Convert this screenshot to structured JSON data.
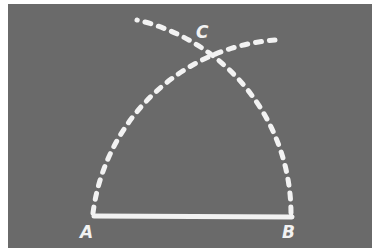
{
  "figure": {
    "colors": {
      "board": "#6a6a6a",
      "chalk": "#f2f2f2",
      "frame": "#ffffff"
    },
    "points": [
      {
        "id": "A",
        "label": "A",
        "x": 93,
        "y": 216
      },
      {
        "id": "B",
        "label": "B",
        "x": 292,
        "y": 216
      },
      {
        "id": "C",
        "label": "C",
        "x": 198,
        "y": 55
      }
    ],
    "segment_AB": {
      "style": "solid"
    },
    "arc_centered_B": {
      "style": "dashed",
      "from": "A",
      "to_end": [
        273,
        40
      ]
    },
    "arc_centered_A": {
      "style": "dashed",
      "from": "B",
      "to_end": [
        137,
        20
      ]
    }
  }
}
